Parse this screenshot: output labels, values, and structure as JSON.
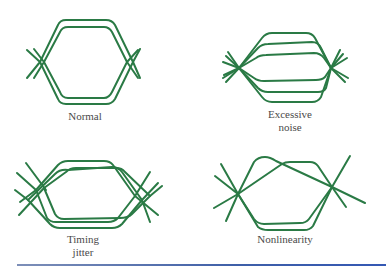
{
  "figure": {
    "panels": [
      {
        "id": "normal",
        "label_lines": [
          "Normal"
        ]
      },
      {
        "id": "excessive-noise",
        "label_lines": [
          "Excessive",
          "noise"
        ]
      },
      {
        "id": "timing-jitter",
        "label_lines": [
          "Timing",
          "jitter"
        ]
      },
      {
        "id": "nonlinearity",
        "label_lines": [
          "Nonlinearity"
        ]
      }
    ],
    "colors": {
      "trace": "#2a7a45",
      "label": "#4a4a4a",
      "rule": "#3e5fa8",
      "background": "#ffffff"
    }
  }
}
